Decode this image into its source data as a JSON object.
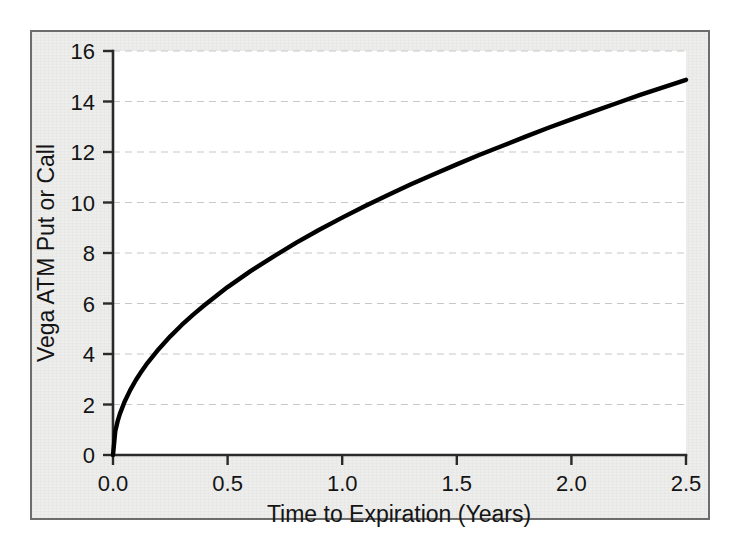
{
  "figure": {
    "background_color": "#ededec",
    "plot_background_color": "#ffffff",
    "frame_border_color": "#6d6d6d",
    "curve_color": "#000000",
    "gridline_color": "#c8c8c8",
    "axis_color": "#2a2a2a"
  },
  "chart_data": {
    "type": "line",
    "title": "",
    "subtitle": "",
    "xlabel": "Time to Expiration (Years)",
    "ylabel": "Vega ATM Put or Call",
    "xlim": [
      0.0,
      2.5
    ],
    "ylim": [
      0,
      16
    ],
    "xticks": [
      0.0,
      0.5,
      1.0,
      1.5,
      2.0,
      2.5
    ],
    "xticklabels": [
      "0.0",
      "0.5",
      "1.0",
      "1.5",
      "2.0",
      "2.5"
    ],
    "yticks": [
      0,
      2,
      4,
      6,
      8,
      10,
      12,
      14,
      16
    ],
    "yticklabels": [
      "0",
      "2",
      "4",
      "6",
      "8",
      "10",
      "12",
      "14",
      "16"
    ],
    "grid": true,
    "grid_axis": "y",
    "grid_style": "dashed",
    "legend": null,
    "legend_position": "none",
    "annotations": [],
    "series": [
      {
        "name": "Vega ATM Put or Call",
        "relationship": "vega = 9.4 * sqrt(t)",
        "x": [
          0.0,
          0.01,
          0.02,
          0.03,
          0.05,
          0.075,
          0.1,
          0.125,
          0.15,
          0.2,
          0.25,
          0.3,
          0.35,
          0.4,
          0.45,
          0.5,
          0.6,
          0.7,
          0.8,
          0.9,
          1.0,
          1.1,
          1.2,
          1.3,
          1.4,
          1.5,
          1.6,
          1.7,
          1.8,
          1.9,
          2.0,
          2.1,
          2.2,
          2.3,
          2.4,
          2.5
        ],
        "y": [
          0.0,
          0.94,
          1.33,
          1.63,
          2.1,
          2.57,
          2.97,
          3.32,
          3.64,
          4.2,
          4.7,
          5.15,
          5.56,
          5.94,
          6.3,
          6.65,
          7.28,
          7.86,
          8.41,
          8.92,
          9.4,
          9.86,
          10.3,
          10.72,
          11.12,
          11.51,
          11.89,
          12.25,
          12.61,
          12.96,
          13.29,
          13.62,
          13.94,
          14.26,
          14.56,
          14.86
        ]
      }
    ]
  }
}
